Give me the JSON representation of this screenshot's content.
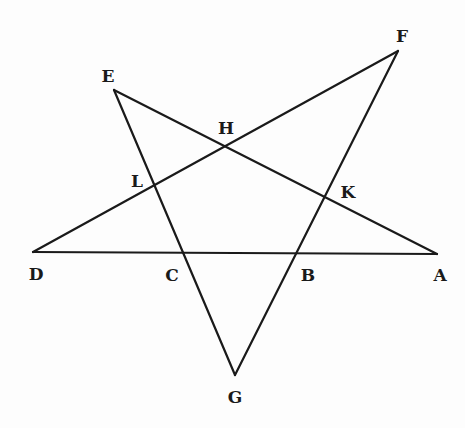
{
  "diagram": {
    "type": "pentagram",
    "colors": {
      "line": "#1a1a1a",
      "label": "#1a1a1a",
      "background": "#fdfdfd"
    },
    "points": {
      "A": {
        "label": "A",
        "x": 437,
        "y": 254,
        "label_x": 440,
        "label_y": 276
      },
      "B": {
        "label": "B",
        "x": 296,
        "y": 255,
        "label_x": 308,
        "label_y": 276
      },
      "C": {
        "label": "C",
        "x": 183,
        "y": 254,
        "label_x": 172,
        "label_y": 276
      },
      "D": {
        "label": "D",
        "x": 33,
        "y": 252,
        "label_x": 36,
        "label_y": 275
      },
      "E": {
        "label": "E",
        "x": 114,
        "y": 90,
        "label_x": 108,
        "label_y": 77
      },
      "F": {
        "label": "F",
        "x": 398,
        "y": 51,
        "label_x": 402,
        "label_y": 37
      },
      "G": {
        "label": "G",
        "x": 235,
        "y": 375,
        "label_x": 235,
        "label_y": 398
      },
      "H": {
        "label": "H",
        "x": 225,
        "y": 147,
        "label_x": 226,
        "label_y": 129
      },
      "K": {
        "label": "K",
        "x": 325,
        "y": 197,
        "label_x": 348,
        "label_y": 193
      },
      "L": {
        "label": "L",
        "x": 153,
        "y": 186,
        "label_x": 137,
        "label_y": 182
      }
    },
    "segments": [
      {
        "name": "DA",
        "from": "D",
        "to": "A"
      },
      {
        "name": "DF",
        "from": "D",
        "to": "F"
      },
      {
        "name": "FG",
        "from": "F",
        "to": "G"
      },
      {
        "name": "GE",
        "from": "G",
        "to": "E"
      },
      {
        "name": "EA",
        "from": "E",
        "to": "A"
      }
    ]
  }
}
